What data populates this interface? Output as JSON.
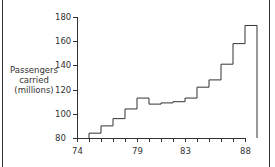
{
  "chart_data": {
    "type": "line",
    "subtype": "step",
    "title": "",
    "xlabel": "",
    "ylabel": "Passengers carried (millions)",
    "ylabel_lines": [
      "Passengers",
      "carried",
      "(millions)"
    ],
    "x": [
      74,
      75,
      76,
      77,
      78,
      79,
      80,
      81,
      82,
      83,
      84,
      85,
      86,
      87
    ],
    "values": [
      84,
      90,
      96,
      104,
      113,
      108,
      109,
      110,
      113,
      122,
      128,
      141,
      158,
      173
    ],
    "xlim": [
      74,
      88
    ],
    "ylim": [
      80,
      180
    ],
    "xticks": [
      74,
      79,
      83,
      88
    ],
    "yticks": [
      80,
      100,
      120,
      140,
      160,
      180
    ],
    "grid": false,
    "legend": null
  }
}
